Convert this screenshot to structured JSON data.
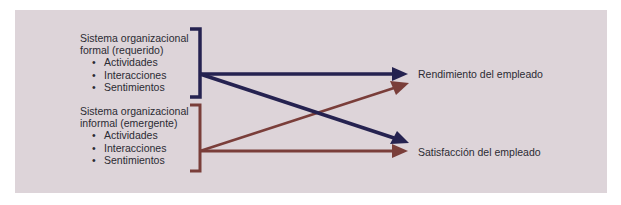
{
  "colors": {
    "background": "#ffffff",
    "panel": "#ddd4d9",
    "formal": "#252250",
    "informal": "#7a3e3a",
    "text": "#2b2b33"
  },
  "formal_system": {
    "title_line1": "Sistema organizacional",
    "title_line2": "formal (requerido)",
    "items": [
      "Actividades",
      "Interacciones",
      "Sentimientos"
    ]
  },
  "informal_system": {
    "title_line1": "Sistema organizacional",
    "title_line2": "informal (emergente)",
    "items": [
      "Actividades",
      "Interacciones",
      "Sentimientos"
    ]
  },
  "outcomes": {
    "performance": "Rendimiento del empleado",
    "satisfaction": "Satisfacción del empleado"
  },
  "bullet": "•",
  "edges": [
    {
      "from": "formal_system",
      "to": "performance",
      "color": "formal"
    },
    {
      "from": "formal_system",
      "to": "satisfaction",
      "color": "formal"
    },
    {
      "from": "informal_system",
      "to": "performance",
      "color": "informal"
    },
    {
      "from": "informal_system",
      "to": "satisfaction",
      "color": "informal"
    }
  ]
}
